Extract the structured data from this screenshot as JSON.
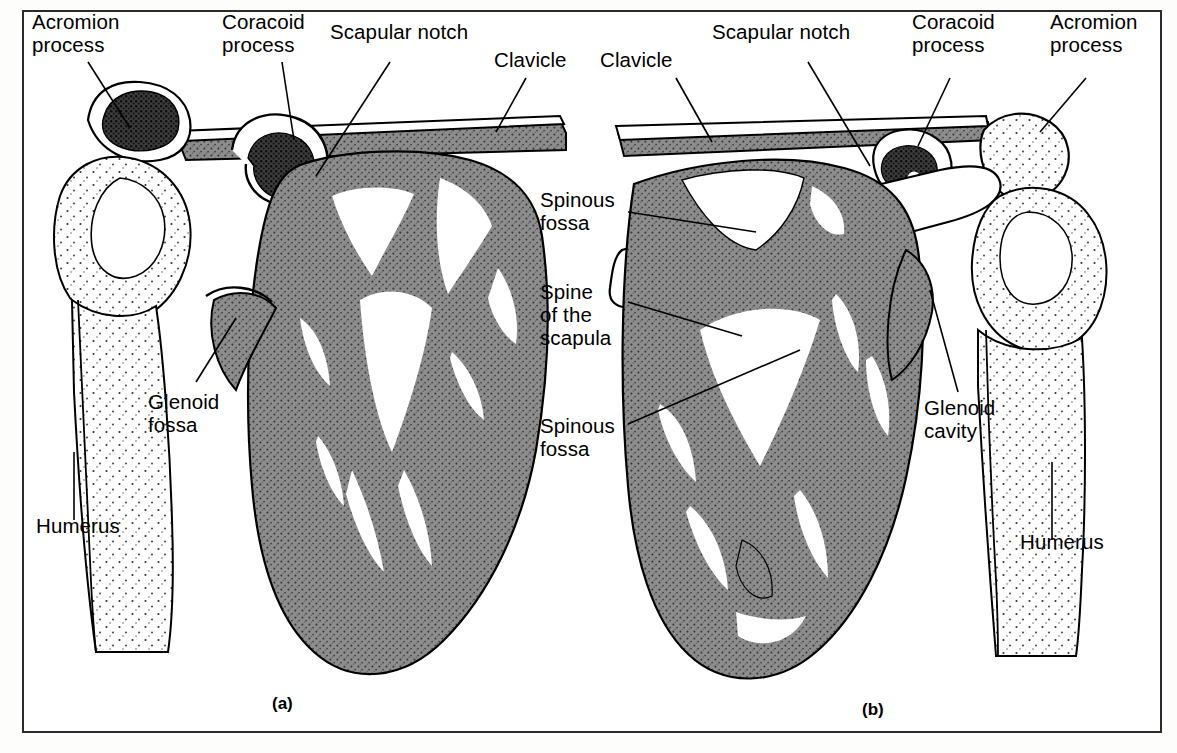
{
  "figure": {
    "type": "anatomical-illustration",
    "panels": [
      {
        "id": "a",
        "caption": "(a)",
        "view": "anterior"
      },
      {
        "id": "b",
        "caption": "(b)",
        "view": "posterior"
      }
    ],
    "colors": {
      "ink": "#000000",
      "cancellous_gray": "#8a8a8a",
      "dense_dark": "#2a2a2a",
      "paper": "#ffffff",
      "frame": "#2b2b2b"
    }
  },
  "labels_left": [
    {
      "id": "acromion-process-left",
      "text": "Acromion\nprocess"
    },
    {
      "id": "coracoid-process-left",
      "text": "Coracoid\nprocess"
    },
    {
      "id": "scapular-notch-left",
      "text": "Scapular notch"
    },
    {
      "id": "clavicle-left",
      "text": "Clavicle"
    },
    {
      "id": "glenoid-fossa-left",
      "text": "Glenoid\nfossa"
    },
    {
      "id": "humerus-left",
      "text": "Humerus"
    }
  ],
  "labels_center": [
    {
      "id": "spinous-fossa-upper",
      "text": "Spinous\nfossa"
    },
    {
      "id": "spine-of-the-scapula",
      "text": "Spine\nof the\nscapula"
    },
    {
      "id": "spinous-fossa-lower",
      "text": "Spinous\nfossa"
    }
  ],
  "labels_right": [
    {
      "id": "clavicle-right",
      "text": "Clavicle"
    },
    {
      "id": "scapular-notch-right",
      "text": "Scapular notch"
    },
    {
      "id": "coracoid-process-right",
      "text": "Coracoid\nprocess"
    },
    {
      "id": "acromion-process-right",
      "text": "Acromion\nprocess"
    },
    {
      "id": "glenoid-cavity-right",
      "text": "Glenoid\ncavity"
    },
    {
      "id": "humerus-right",
      "text": "Humerus"
    }
  ],
  "captions": {
    "a": "(a)",
    "b": "(b)"
  }
}
